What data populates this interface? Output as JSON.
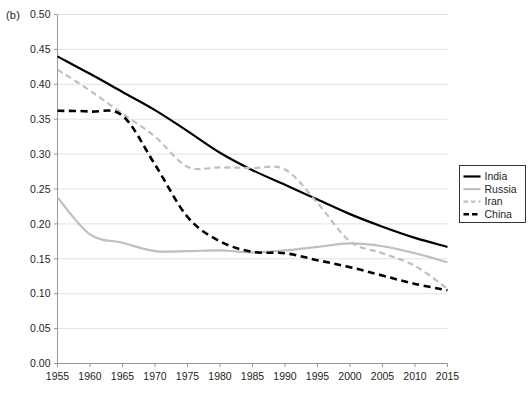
{
  "panel": {
    "label": "(b)"
  },
  "legend": {
    "position": "right-middle",
    "entries": [
      {
        "label": "India",
        "color": "#000000",
        "style": "solid",
        "width": 2.2
      },
      {
        "label": "Russia",
        "color": "#bfbfbf",
        "style": "solid",
        "width": 2.2
      },
      {
        "label": "Iran",
        "color": "#bfbfbf",
        "style": "dashed",
        "width": 2.2
      },
      {
        "label": "China",
        "color": "#000000",
        "style": "dashed",
        "width": 2.4
      }
    ]
  },
  "chart_data": {
    "type": "line",
    "title": "",
    "xlabel": "",
    "ylabel": "",
    "grid": true,
    "xlim": [
      1955,
      2015
    ],
    "ylim": [
      0.0,
      0.5
    ],
    "ytick_step": 0.05,
    "x": [
      1955,
      1960,
      1965,
      1970,
      1975,
      1980,
      1985,
      1990,
      1995,
      2000,
      2005,
      2010,
      2015
    ],
    "categories": [
      "1955",
      "1960",
      "1965",
      "1970",
      "1975",
      "1980",
      "1985",
      "1990",
      "1995",
      "2000",
      "2005",
      "2010",
      "2015"
    ],
    "ytick_labels": [
      "0.00",
      "0.05",
      "0.10",
      "0.15",
      "0.20",
      "0.25",
      "0.30",
      "0.35",
      "0.40",
      "0.45",
      "0.50"
    ],
    "ytick_values": [
      0.0,
      0.05,
      0.1,
      0.15,
      0.2,
      0.25,
      0.3,
      0.35,
      0.4,
      0.45,
      0.5
    ],
    "series": [
      {
        "name": "India",
        "color": "#000000",
        "style": "solid",
        "values": [
          0.44,
          0.415,
          0.389,
          0.363,
          0.333,
          0.302,
          0.277,
          0.256,
          0.235,
          0.214,
          0.196,
          0.18,
          0.167
        ]
      },
      {
        "name": "Russia",
        "color": "#bfbfbf",
        "style": "solid",
        "values": [
          0.238,
          0.185,
          0.173,
          0.161,
          0.161,
          0.162,
          0.159,
          0.162,
          0.167,
          0.172,
          0.168,
          0.158,
          0.145
        ]
      },
      {
        "name": "Iran",
        "color": "#bfbfbf",
        "style": "dashed",
        "values": [
          0.421,
          0.391,
          0.358,
          0.325,
          0.282,
          0.281,
          0.28,
          0.278,
          0.23,
          0.175,
          0.158,
          0.14,
          0.107
        ]
      },
      {
        "name": "China",
        "color": "#000000",
        "style": "dashed",
        "values": [
          0.362,
          0.361,
          0.355,
          0.285,
          0.21,
          0.175,
          0.16,
          0.158,
          0.148,
          0.138,
          0.126,
          0.114,
          0.105
        ]
      }
    ]
  }
}
